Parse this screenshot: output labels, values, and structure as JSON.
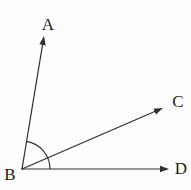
{
  "figure": {
    "width": 191,
    "height": 190,
    "background_color": "#fdfdfd",
    "line_color": "#2e2e2e",
    "label_color": "#1c1c1c",
    "vertex": {
      "label": "B",
      "x": 22,
      "y": 169,
      "label_x": 10,
      "label_y": 180
    },
    "rays": [
      {
        "name": "BA",
        "label": "A",
        "tip_x": 44,
        "tip_y": 36,
        "label_x": 48,
        "label_y": 30
      },
      {
        "name": "BC",
        "label": "C",
        "tip_x": 163,
        "tip_y": 108,
        "label_x": 178,
        "label_y": 107
      },
      {
        "name": "BD",
        "label": "D",
        "tip_x": 169,
        "tip_y": 169,
        "label_x": 181,
        "label_y": 174
      }
    ],
    "angle_arc": {
      "radius": 28,
      "start_deg": 0,
      "end_deg": 80.6
    },
    "arrowhead": {
      "length": 9,
      "half_width": 3.2
    }
  }
}
